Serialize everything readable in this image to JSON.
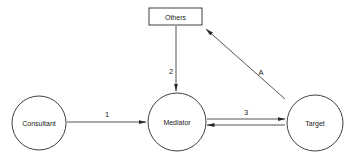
{
  "diagram": {
    "nodes": [
      {
        "id": "consultant",
        "label": "Consultant",
        "shape": "circle"
      },
      {
        "id": "mediator",
        "label": "Mediator",
        "shape": "circle"
      },
      {
        "id": "target",
        "label": "Target",
        "shape": "circle"
      },
      {
        "id": "others",
        "label": "Others",
        "shape": "rectangle"
      }
    ],
    "edges": [
      {
        "from": "consultant",
        "to": "mediator",
        "label": "1"
      },
      {
        "from": "others",
        "to": "mediator",
        "label": "2"
      },
      {
        "from": "mediator",
        "to": "target",
        "label": "3"
      },
      {
        "from": "target",
        "to": "mediator",
        "label": ""
      },
      {
        "from": "target",
        "to": "others",
        "label": "A"
      }
    ],
    "colors": {
      "stroke": "#2a2a2a",
      "background": "#ffffff",
      "text": "#222222"
    }
  }
}
